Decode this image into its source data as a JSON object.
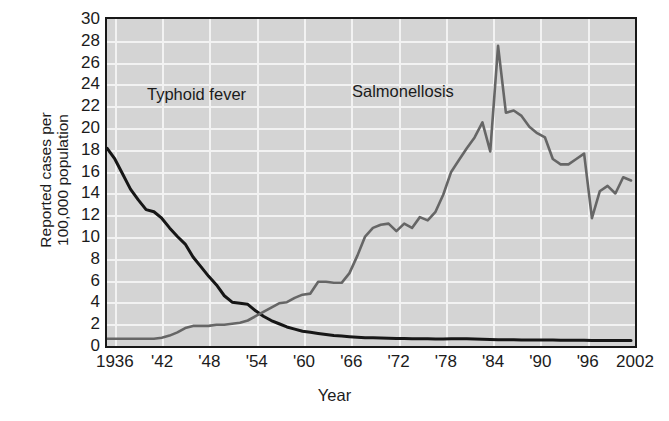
{
  "chart_data": {
    "type": "line",
    "title": "",
    "subtitle": "",
    "xlabel": "Year",
    "ylabel": "Reported cases per 100,000 population",
    "ylabel_line1": "Reported cases per",
    "ylabel_line2": "100,000 population",
    "xlim": [
      1935,
      2002
    ],
    "ylim": [
      0,
      30
    ],
    "ytick_step": 2,
    "xtick_step": 6,
    "grid": true,
    "legend_position": "inline-annotations",
    "plot_background": "#d4d4d4",
    "grid_color": "#f2f2f2",
    "frame_color": "#181818",
    "yticks": [
      30,
      28,
      26,
      24,
      22,
      20,
      18,
      16,
      14,
      12,
      10,
      8,
      6,
      4,
      2,
      0
    ],
    "xticks": [
      "1936",
      "'42",
      "'48",
      "'54",
      "'60",
      "'66",
      "'72",
      "'78",
      "'84",
      "'90",
      "'96",
      "2002"
    ],
    "xtick_years": [
      1936,
      1942,
      1948,
      1954,
      1960,
      1966,
      1972,
      1978,
      1984,
      1990,
      1996,
      2002
    ],
    "annotations": [
      {
        "text": "Typhoid fever",
        "year": 1941,
        "value": 12.2
      },
      {
        "text": "Salmonellosis",
        "year": 1966,
        "value": 22.8
      }
    ],
    "series": [
      {
        "name": "Typhoid fever",
        "color": "#161616",
        "width": 3.0,
        "x": [
          1935,
          1936,
          1937,
          1938,
          1939,
          1940,
          1941,
          1942,
          1943,
          1944,
          1945,
          1946,
          1947,
          1948,
          1949,
          1950,
          1951,
          1952,
          1953,
          1954,
          1955,
          1956,
          1957,
          1958,
          1959,
          1960,
          1961,
          1962,
          1963,
          1964,
          1965,
          1966,
          1967,
          1968,
          1969,
          1970,
          1971,
          1972,
          1973,
          1974,
          1975,
          1976,
          1977,
          1978,
          1979,
          1980,
          1981,
          1982,
          1983,
          1984,
          1985,
          1986,
          1987,
          1988,
          1989,
          1990,
          1991,
          1992,
          1993,
          1994,
          1995,
          1996,
          1997,
          1998,
          1999,
          2000,
          2001,
          2002
        ],
        "values": [
          18.0,
          17.0,
          15.6,
          14.2,
          13.2,
          12.3,
          12.1,
          11.5,
          10.6,
          9.8,
          9.1,
          7.9,
          7.0,
          6.1,
          5.3,
          4.3,
          3.7,
          3.6,
          3.5,
          2.9,
          2.4,
          2.0,
          1.7,
          1.4,
          1.2,
          1.0,
          0.9,
          0.8,
          0.7,
          0.6,
          0.55,
          0.5,
          0.45,
          0.4,
          0.4,
          0.38,
          0.35,
          0.33,
          0.32,
          0.3,
          0.3,
          0.3,
          0.28,
          0.28,
          0.3,
          0.3,
          0.3,
          0.28,
          0.26,
          0.24,
          0.22,
          0.22,
          0.22,
          0.2,
          0.2,
          0.2,
          0.18,
          0.18,
          0.17,
          0.17,
          0.16,
          0.16,
          0.15,
          0.15,
          0.15,
          0.14,
          0.14,
          0.14
        ]
      },
      {
        "name": "Salmonellosis",
        "color": "#666666",
        "width": 2.6,
        "x": [
          1935,
          1936,
          1937,
          1938,
          1939,
          1940,
          1941,
          1942,
          1943,
          1944,
          1945,
          1946,
          1947,
          1948,
          1949,
          1950,
          1951,
          1952,
          1953,
          1954,
          1955,
          1956,
          1957,
          1958,
          1959,
          1960,
          1961,
          1962,
          1963,
          1964,
          1965,
          1966,
          1967,
          1968,
          1969,
          1970,
          1971,
          1972,
          1973,
          1974,
          1975,
          1976,
          1977,
          1978,
          1979,
          1980,
          1981,
          1982,
          1983,
          1984,
          1985,
          1986,
          1987,
          1988,
          1989,
          1990,
          1991,
          1992,
          1993,
          1994,
          1995,
          1996,
          1997,
          1998,
          1999,
          2000,
          2001,
          2002
        ],
        "values": [
          0.3,
          0.3,
          0.3,
          0.3,
          0.3,
          0.3,
          0.3,
          0.4,
          0.6,
          0.9,
          1.3,
          1.5,
          1.5,
          1.5,
          1.6,
          1.6,
          1.7,
          1.8,
          2.0,
          2.4,
          2.8,
          3.2,
          3.6,
          3.7,
          4.1,
          4.4,
          4.5,
          5.6,
          5.6,
          5.5,
          5.5,
          6.4,
          8.0,
          9.8,
          10.6,
          10.9,
          11.0,
          10.3,
          11.0,
          10.6,
          11.6,
          11.3,
          12.1,
          13.7,
          15.8,
          16.9,
          18.0,
          19.0,
          20.4,
          17.7,
          27.5,
          21.3,
          21.5,
          21.0,
          20.0,
          19.4,
          19.0,
          17.0,
          16.5,
          16.5,
          17.0,
          17.5,
          11.5,
          14.0,
          14.5,
          13.8,
          15.3,
          15.0
        ]
      }
    ]
  }
}
